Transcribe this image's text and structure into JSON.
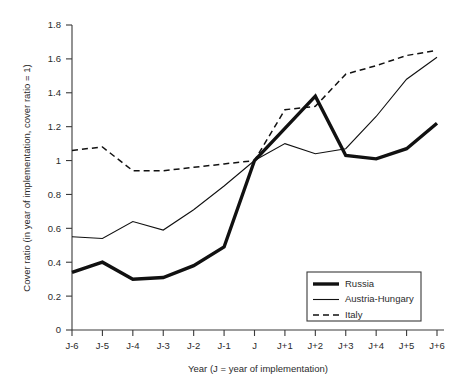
{
  "chart_data": {
    "type": "line",
    "title": "",
    "xlabel": "Year (J = year of implementation)",
    "ylabel": "Cover ratio (in year of implementation, cover ratio = 1)",
    "categories": [
      "J-6",
      "J-5",
      "J-4",
      "J-3",
      "J-2",
      "J-1",
      "J",
      "J+1",
      "J+2",
      "J+3",
      "J+4",
      "J+5",
      "J+6"
    ],
    "ytick_labels": [
      "0",
      "0.2",
      "0.4",
      "0.6",
      "0.8",
      "1",
      "1.2",
      "1.4",
      "1.6",
      "1.8"
    ],
    "ytick_values": [
      0,
      0.2,
      0.4,
      0.6,
      0.8,
      1.0,
      1.2,
      1.4,
      1.6,
      1.8
    ],
    "ylim": [
      0,
      1.8
    ],
    "grid": false,
    "legend_position": "lower-right-inside",
    "series": [
      {
        "name": "Russia",
        "style": "thick-solid",
        "color": "#111111",
        "values": [
          0.34,
          0.4,
          0.3,
          0.31,
          0.38,
          0.49,
          1.0,
          1.19,
          1.38,
          1.03,
          1.01,
          1.07,
          1.22
        ]
      },
      {
        "name": "Austria-Hungary",
        "style": "thin-solid",
        "color": "#111111",
        "values": [
          0.55,
          0.54,
          0.64,
          0.59,
          0.71,
          0.85,
          1.0,
          1.1,
          1.04,
          1.07,
          1.26,
          1.48,
          1.61
        ]
      },
      {
        "name": "Italy",
        "style": "dashed",
        "color": "#111111",
        "values": [
          1.06,
          1.08,
          0.94,
          0.94,
          0.96,
          0.98,
          1.0,
          1.3,
          1.32,
          1.51,
          1.56,
          1.62,
          1.65
        ]
      }
    ]
  },
  "legend": {
    "items": [
      {
        "label": "Russia"
      },
      {
        "label": "Austria-Hungary"
      },
      {
        "label": "Italy"
      }
    ]
  }
}
